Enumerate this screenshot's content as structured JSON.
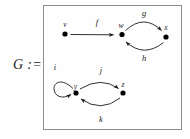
{
  "figure": {
    "definition_label": "G :=",
    "box": {
      "border_color": "#8d8d8d"
    },
    "background": "#fefefe",
    "ink_color": "#1a1a1a"
  },
  "graph": {
    "vertices": [
      {
        "id": "v",
        "label": "v",
        "x": 65,
        "y": 34
      },
      {
        "id": "w",
        "label": "w",
        "x": 122,
        "y": 34
      },
      {
        "id": "x",
        "label": "x",
        "x": 166,
        "y": 37
      },
      {
        "id": "y",
        "label": "y",
        "x": 76,
        "y": 93
      },
      {
        "id": "z",
        "label": "z",
        "x": 123,
        "y": 93
      }
    ],
    "edges": [
      {
        "id": "f",
        "label": "f",
        "from": "v",
        "to": "w",
        "shape": "straight",
        "label_x": 97,
        "label_y": 25
      },
      {
        "id": "g",
        "label": "g",
        "from": "w",
        "to": "x",
        "shape": "arc-up",
        "label_x": 144,
        "label_y": 16
      },
      {
        "id": "h",
        "label": "h",
        "from": "x",
        "to": "w",
        "shape": "arc-down",
        "label_x": 144,
        "label_y": 61
      },
      {
        "id": "i",
        "label": "i",
        "from": "y",
        "to": "y",
        "shape": "self-loop",
        "label_x": 55,
        "label_y": 70
      },
      {
        "id": "j",
        "label": "j",
        "from": "y",
        "to": "z",
        "shape": "arc-up",
        "label_x": 101,
        "label_y": 73
      },
      {
        "id": "k",
        "label": "k",
        "from": "z",
        "to": "y",
        "shape": "arc-down",
        "label_x": 101,
        "label_y": 122
      }
    ]
  }
}
